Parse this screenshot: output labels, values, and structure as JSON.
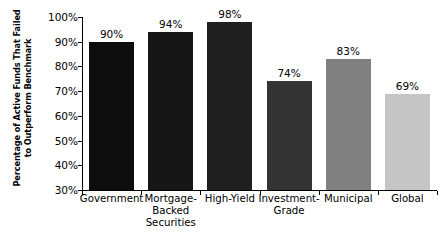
{
  "chart_data": {
    "type": "bar",
    "title": "",
    "xlabel": "",
    "ylabel": "Percentage of Active Funds That Failed to Outperform Benchmark",
    "ylabel_lines": [
      "Percentage of Active Funds That Failed",
      "to Outperform Benchmark"
    ],
    "categories": [
      "Government",
      "Mortgage-Backed Securities",
      "High-Yield",
      "Investment-Grade",
      "Municipal",
      "Global"
    ],
    "category_lines": [
      [
        "Government"
      ],
      [
        "Mortgage-",
        "Backed",
        "Securities"
      ],
      [
        "High-Yield"
      ],
      [
        "Investment-",
        "Grade"
      ],
      [
        "Municipal"
      ],
      [
        "Global"
      ]
    ],
    "values": [
      90,
      94,
      98,
      74,
      83,
      69
    ],
    "value_labels": [
      "90%",
      "94%",
      "98%",
      "74%",
      "83%",
      "69%"
    ],
    "bar_colors": [
      "#0d0d0d",
      "#161616",
      "#1f1f1f",
      "#333333",
      "#808080",
      "#c5c5c5"
    ],
    "ylim": [
      30,
      100
    ],
    "ytick_values": [
      100,
      90,
      80,
      70,
      60,
      50,
      40,
      30
    ],
    "ytick_labels": [
      "100%",
      "90%",
      "80%",
      "70%",
      "60%",
      "50%",
      "40%",
      "30%"
    ],
    "grid": false,
    "legend": null,
    "axis_color": "#000000",
    "background": "#ffffff"
  }
}
